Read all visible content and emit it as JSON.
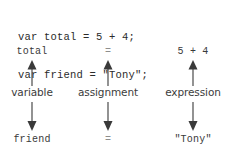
{
  "code": {
    "lines": [
      "var total = 5 + 4;",
      "var friend = \"Tony\";"
    ]
  },
  "diagram": {
    "columns": [
      {
        "name": "variable",
        "top_term": "total",
        "label": "variable",
        "bottom_term": "friend",
        "up_arrow_icon": "arrow-up-icon",
        "down_arrow_icon": "arrow-down-icon"
      },
      {
        "name": "assignment",
        "top_term": "=",
        "label": "assignment",
        "bottom_term": "=",
        "up_arrow_icon": "arrow-up-icon",
        "down_arrow_icon": "arrow-down-icon"
      },
      {
        "name": "expression",
        "top_term": "5 + 4",
        "label": "expression",
        "bottom_term": "\"Tony\"",
        "up_arrow_icon": "arrow-up-icon",
        "down_arrow_icon": "arrow-down-icon"
      }
    ]
  },
  "colors": {
    "background": "#ffffff",
    "code_text": "#2b2b2b",
    "term_text": "#3a3a3a",
    "label_text": "#3c3c3c",
    "faint_text": "#8e8e8e",
    "arrow": "#3a3a3a"
  }
}
